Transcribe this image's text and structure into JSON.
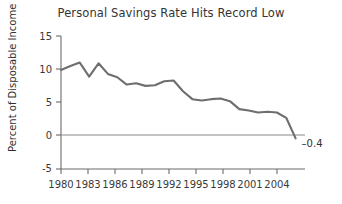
{
  "chart_data": {
    "type": "line",
    "title": "Personal Savings Rate Hits Record Low",
    "xlabel": "",
    "ylabel": "Percent of Disposable Income",
    "xlim": [
      1980,
      2006
    ],
    "ylim": [
      -5,
      15
    ],
    "yticks": [
      15,
      10,
      5,
      0,
      -5
    ],
    "ytick_labels": [
      "15",
      "10",
      "5",
      "0",
      "-5"
    ],
    "xticks": [
      1980,
      1983,
      1986,
      1989,
      1992,
      1995,
      1998,
      2001,
      2004
    ],
    "xtick_labels": [
      "1980",
      "1983",
      "1986",
      "1989",
      "1992",
      "1995",
      "1998",
      "2001",
      "2004"
    ],
    "grid": false,
    "legend": false,
    "zero_reference_line": true,
    "series": [
      {
        "name": "Personal Savings Rate",
        "color": "#6e6e6e",
        "x": [
          1980,
          1981,
          1982,
          1983,
          1984,
          1985,
          1986,
          1987,
          1988,
          1989,
          1990,
          1991,
          1992,
          1993,
          1994,
          1995,
          1996,
          1997,
          1998,
          1999,
          2000,
          2001,
          2002,
          2003,
          2004,
          2005
        ],
        "values": [
          9.9,
          10.5,
          11.0,
          8.9,
          10.9,
          9.3,
          8.8,
          7.7,
          7.9,
          7.5,
          7.6,
          8.2,
          8.3,
          6.7,
          5.5,
          5.3,
          5.5,
          5.6,
          5.2,
          4.0,
          3.8,
          3.5,
          3.6,
          3.5,
          2.7,
          -0.4
        ]
      }
    ],
    "annotations": [
      {
        "name": "endpoint-value",
        "text": "–0.4",
        "x": 2005,
        "y": -0.4
      }
    ]
  }
}
